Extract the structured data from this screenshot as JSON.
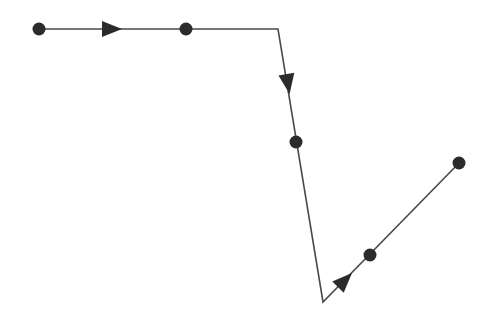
{
  "diagram": {
    "type": "directed-path",
    "width": 491,
    "height": 323,
    "background": "#ffffff",
    "stroke_color": "#4a4a4a",
    "fill_color": "#2b2b2b",
    "stroke_width": 1.6,
    "polyline": [
      [
        39,
        29
      ],
      [
        278,
        29
      ],
      [
        323,
        302
      ],
      [
        459,
        163
      ]
    ],
    "nodes": [
      {
        "id": "n1",
        "x": 39,
        "y": 29,
        "r": 6.5
      },
      {
        "id": "n2",
        "x": 186,
        "y": 29,
        "r": 6.5
      },
      {
        "id": "n3",
        "x": 296,
        "y": 142,
        "r": 6.5
      },
      {
        "id": "n4",
        "x": 370,
        "y": 255,
        "r": 6.5
      },
      {
        "id": "n5",
        "x": 459,
        "y": 163,
        "r": 6.5
      }
    ],
    "arrows": [
      {
        "id": "a1",
        "x": 112,
        "y": 29,
        "from": [
          39,
          29
        ],
        "to": [
          278,
          29
        ],
        "length": 20,
        "half_width": 8
      },
      {
        "id": "a2",
        "x": 288,
        "y": 84,
        "from": [
          278,
          29
        ],
        "to": [
          323,
          302
        ],
        "length": 20,
        "half_width": 8
      },
      {
        "id": "a3",
        "x": 345,
        "y": 280,
        "from": [
          323,
          302
        ],
        "to": [
          459,
          163
        ],
        "length": 20,
        "half_width": 8
      }
    ]
  }
}
